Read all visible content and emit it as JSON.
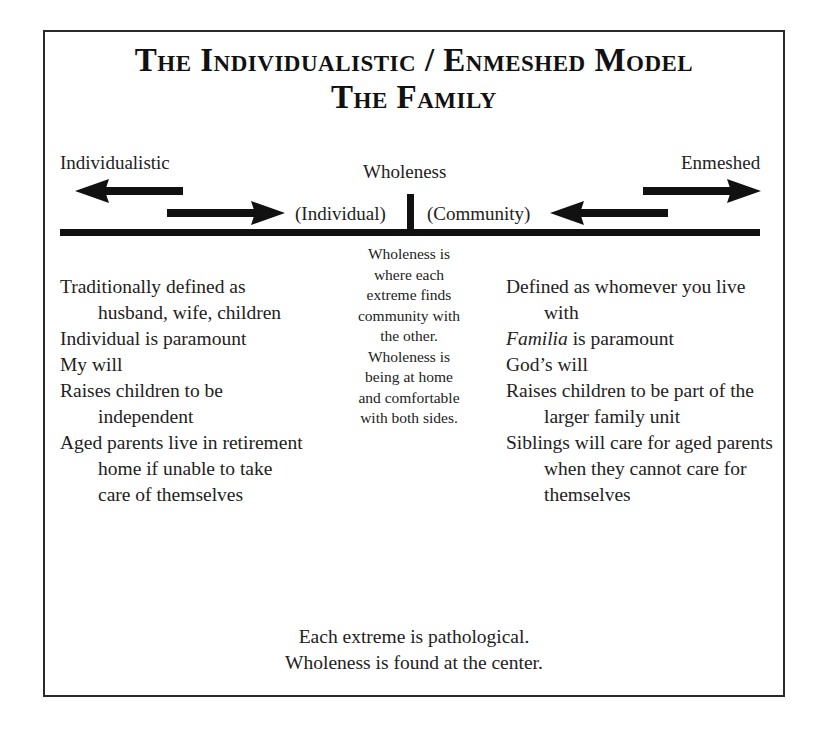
{
  "title": {
    "line1": "The Individualistic / Enmeshed Model",
    "line2": "The Family"
  },
  "axis": {
    "left_label": "Individualistic",
    "center_label": "Wholeness",
    "right_label": "Enmeshed",
    "center_left_label": "(Individual)",
    "center_right_label": "(Community)",
    "arrows": [
      {
        "name": "individualistic-arrow",
        "direction": "left"
      },
      {
        "name": "toward-center-from-left-arrow",
        "direction": "right"
      },
      {
        "name": "toward-center-from-right-arrow",
        "direction": "left"
      },
      {
        "name": "enmeshed-arrow",
        "direction": "right"
      }
    ]
  },
  "center_text": [
    "Wholeness is",
    "where each",
    "extreme finds",
    "community with",
    "the other.",
    "Wholeness is",
    "being at home",
    "and comfortable",
    "with both sides."
  ],
  "left_column": {
    "items": [
      "Traditionally defined as husband, wife, children",
      "Individual is paramount",
      "My will",
      "Raises children to be independent",
      "Aged parents live in retirement home if unable to take care of themselves"
    ]
  },
  "right_column": {
    "items": [
      "Defined as whomever you live with",
      "is paramount",
      "God’s will",
      "Raises children to be part of the larger family unit",
      "Siblings will care for aged parents when they cannot care for themselves"
    ],
    "italic_word": "Familia"
  },
  "footer": {
    "line1": "Each extreme is pathological.",
    "line2": "Wholeness is found at the center."
  },
  "colors": {
    "ink": "#111111",
    "text": "#222222",
    "background": "#ffffff"
  }
}
